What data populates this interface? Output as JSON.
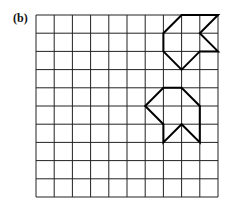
{
  "label": "(b)",
  "grid": {
    "cols": 10,
    "rows": 10,
    "x0": 36,
    "y0": 15,
    "cell": 18.2,
    "line_color": "#222222"
  },
  "shapes": [
    {
      "name": "shape-original",
      "points": [
        [
          8,
          0
        ],
        [
          10,
          0
        ],
        [
          9,
          1
        ],
        [
          10,
          2
        ],
        [
          9,
          2
        ],
        [
          8,
          3
        ],
        [
          7,
          2
        ],
        [
          7,
          1
        ]
      ]
    },
    {
      "name": "shape-transformed",
      "points": [
        [
          7,
          4
        ],
        [
          8,
          4
        ],
        [
          9,
          5
        ],
        [
          9,
          7
        ],
        [
          8,
          6
        ],
        [
          7,
          7
        ],
        [
          7,
          6
        ],
        [
          6,
          5
        ]
      ]
    }
  ]
}
